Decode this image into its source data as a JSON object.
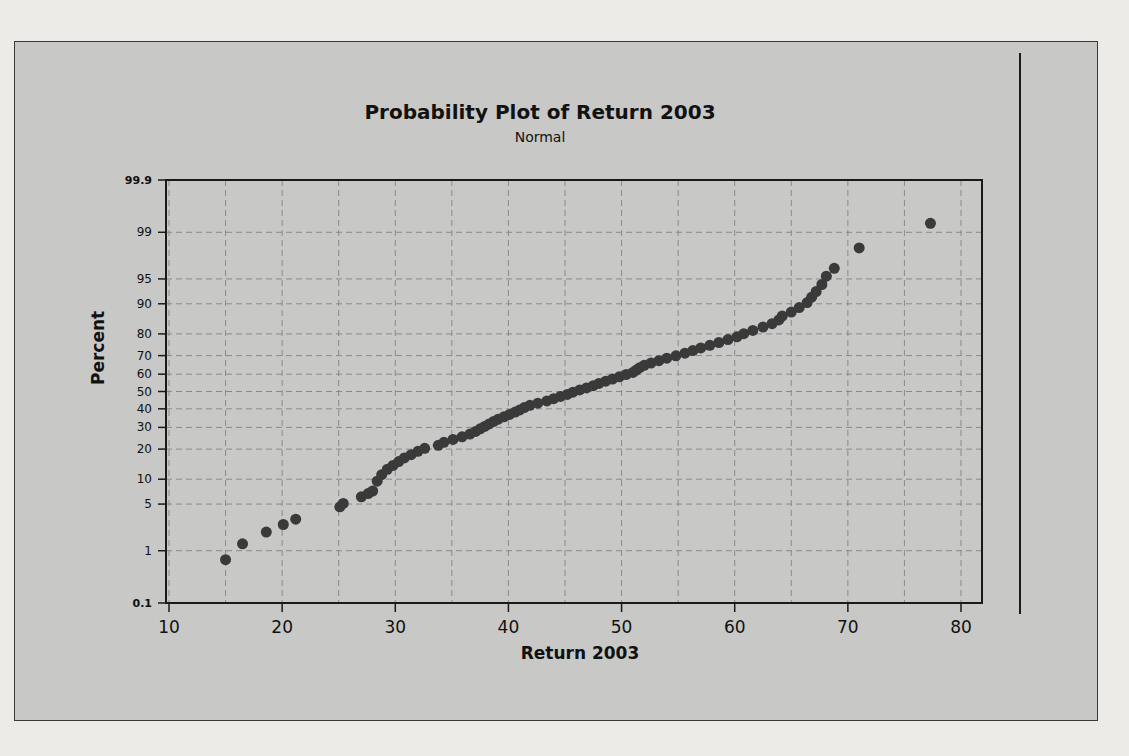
{
  "chart_data": {
    "type": "scatter",
    "title": "Probability Plot of Return 2003",
    "subtitle": "Normal",
    "xlabel": "Return 2003",
    "ylabel": "Percent",
    "xlim": [
      9,
      82
    ],
    "x_ticks": [
      10,
      20,
      30,
      40,
      50,
      60,
      70,
      80
    ],
    "y_ticks": [
      0.1,
      1,
      5,
      10,
      20,
      30,
      40,
      50,
      60,
      70,
      80,
      90,
      95,
      99,
      99.9
    ],
    "y_scale": "normal probability",
    "grid": true,
    "x_gridlines_every": 5,
    "marker_color": "#3a3a3a",
    "points": [
      [
        15.0,
        0.7
      ],
      [
        16.5,
        1.3
      ],
      [
        18.6,
        2.0
      ],
      [
        20.1,
        2.6
      ],
      [
        21.2,
        3.1
      ],
      [
        25.1,
        4.6
      ],
      [
        25.4,
        5.1
      ],
      [
        27.0,
        6.2
      ],
      [
        27.6,
        6.8
      ],
      [
        28.0,
        7.3
      ],
      [
        28.4,
        9.5
      ],
      [
        28.8,
        11.2
      ],
      [
        29.3,
        12.8
      ],
      [
        29.8,
        14.0
      ],
      [
        30.3,
        15.3
      ],
      [
        30.8,
        16.6
      ],
      [
        31.4,
        17.8
      ],
      [
        32.0,
        19.1
      ],
      [
        32.6,
        20.3
      ],
      [
        33.8,
        21.6
      ],
      [
        34.3,
        22.9
      ],
      [
        35.1,
        24.2
      ],
      [
        35.9,
        25.4
      ],
      [
        36.6,
        26.7
      ],
      [
        37.1,
        28.0
      ],
      [
        37.5,
        29.3
      ],
      [
        37.9,
        30.5
      ],
      [
        38.3,
        31.8
      ],
      [
        38.7,
        33.1
      ],
      [
        39.1,
        34.3
      ],
      [
        39.6,
        35.6
      ],
      [
        40.1,
        36.9
      ],
      [
        40.6,
        38.2
      ],
      [
        41.0,
        39.4
      ],
      [
        41.4,
        40.7
      ],
      [
        41.9,
        42.0
      ],
      [
        42.6,
        43.2
      ],
      [
        43.4,
        44.5
      ],
      [
        44.0,
        45.8
      ],
      [
        44.6,
        47.1
      ],
      [
        45.2,
        48.3
      ],
      [
        45.7,
        49.6
      ],
      [
        46.3,
        50.9
      ],
      [
        46.9,
        52.1
      ],
      [
        47.5,
        53.4
      ],
      [
        48.0,
        54.7
      ],
      [
        48.6,
        56.0
      ],
      [
        49.2,
        57.2
      ],
      [
        49.8,
        58.5
      ],
      [
        50.4,
        59.8
      ],
      [
        51.0,
        61.0
      ],
      [
        51.3,
        62.3
      ],
      [
        51.6,
        63.6
      ],
      [
        52.0,
        64.9
      ],
      [
        52.6,
        66.1
      ],
      [
        53.3,
        67.4
      ],
      [
        54.0,
        68.7
      ],
      [
        54.8,
        69.9
      ],
      [
        55.6,
        71.2
      ],
      [
        56.3,
        72.5
      ],
      [
        57.0,
        73.8
      ],
      [
        57.8,
        75.0
      ],
      [
        58.6,
        76.3
      ],
      [
        59.4,
        77.6
      ],
      [
        60.2,
        78.8
      ],
      [
        60.8,
        80.1
      ],
      [
        61.6,
        81.4
      ],
      [
        62.5,
        82.7
      ],
      [
        63.3,
        83.9
      ],
      [
        63.9,
        85.2
      ],
      [
        64.2,
        86.5
      ],
      [
        65.0,
        87.7
      ],
      [
        65.7,
        89.0
      ],
      [
        66.4,
        90.3
      ],
      [
        66.8,
        91.6
      ],
      [
        67.2,
        92.8
      ],
      [
        67.7,
        94.1
      ],
      [
        68.1,
        95.4
      ],
      [
        68.8,
        96.4
      ],
      [
        71.0,
        98.2
      ],
      [
        77.3,
        99.3
      ]
    ]
  },
  "background_page": {
    "bleed_lines": [
      "Central Office I Time to Clear Problems (minutes)",
      "1.48 1.75 0.78 2.85 0.52",
      "1.02 0.53 0.93 1.60 0.80 1.05 0.93",
      "Central Office II Time to Clear Problems (minutes)",
      "For each of the two central office locations:",
      "the data of each central office",
      "a. construct a normal probability plot",
      "b. does the data appear to be",
      "4.18 ... assembled in each of two production plants",
      "packed in cartons) for these jobs, are"
    ],
    "right_column_header": [
      "City",
      "Credit"
    ],
    "right_column_cities": [
      "New York",
      "Orlando",
      "Philadelphia",
      "Phoenix",
      "Sacramento",
      "San Francisco",
      "Seattle",
      "Tampa",
      "Washington"
    ]
  }
}
